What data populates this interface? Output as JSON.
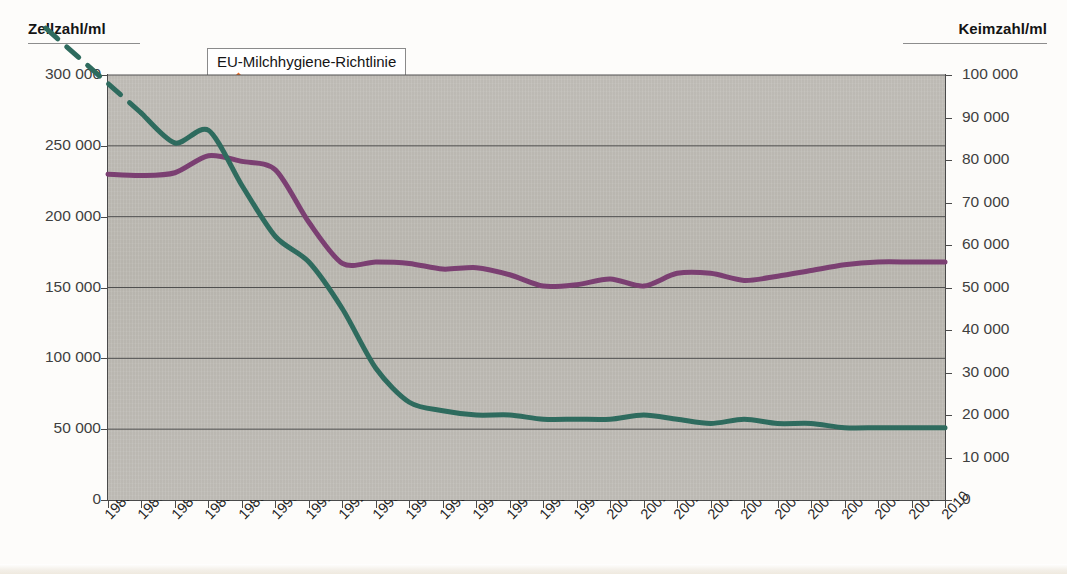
{
  "axes": {
    "left_title": "Zellzahl/ml",
    "right_title": "Keimzahl/ml"
  },
  "legend": {
    "position": "inside-top-center",
    "entries": [
      {
        "label": "Zellzahl (geom. Mittelwert)",
        "color": "#7B3F72"
      },
      {
        "label": "Keimzahl (geom. Mittelwert)",
        "color": "#2E6B5E"
      }
    ]
  },
  "annotations": {
    "eu_directive": "EU-Milchhygiene-Richtlinie",
    "pyruvat": "Pyruvat",
    "keimzahl": "Keimzahl"
  },
  "colors": {
    "zellzahl": "#7B3F72",
    "keimzahl": "#2E6B5E",
    "arrow_orange": "#EF6B1F",
    "arrow_black": "#111111",
    "plot_background": "#B9B6B0",
    "gridline": "#4f4f4f"
  },
  "chart_data": {
    "type": "line",
    "title": "",
    "xlabel": "",
    "ylabel": "Zellzahl/ml",
    "y2label": "Keimzahl/ml",
    "grid": true,
    "x": [
      1985,
      1986,
      1987,
      1988,
      1989,
      1990,
      1991,
      1992,
      1993,
      1994,
      1995,
      1996,
      1997,
      1998,
      1999,
      2000,
      2001,
      2002,
      2003,
      2004,
      2005,
      2006,
      2007,
      2008,
      2009,
      2010
    ],
    "xtick_labels": [
      "1985",
      "1986",
      "1987",
      "1988",
      "1989",
      "1990",
      "1991",
      "1992",
      "1993",
      "1994",
      "1995",
      "1996",
      "1997",
      "1998",
      "1999",
      "2000",
      "2001",
      "2002",
      "2003",
      "2004",
      "2005",
      "2006",
      "2007",
      "2008",
      "2009",
      "2010"
    ],
    "ylim": [
      0,
      300000
    ],
    "yticks": [
      0,
      50000,
      100000,
      150000,
      200000,
      250000,
      300000
    ],
    "ytick_labels": [
      "0",
      "50 000",
      "100 000",
      "150 000",
      "200 000",
      "250 000",
      "300 000"
    ],
    "y2lim": [
      0,
      100000
    ],
    "y2ticks": [
      0,
      10000,
      20000,
      30000,
      40000,
      50000,
      60000,
      70000,
      80000,
      90000,
      100000
    ],
    "y2tick_labels": [
      "0",
      "10 000",
      "20 000",
      "30 000",
      "40 000",
      "50 000",
      "60 000",
      "70 000",
      "80 000",
      "90 000",
      "100 000"
    ],
    "series": [
      {
        "name": "Zellzahl (geom. Mittelwert)",
        "axis": "left",
        "unit": "Zellen/ml",
        "color": "#7B3F72",
        "values": [
          230000,
          229000,
          231000,
          243000,
          239000,
          233000,
          196000,
          167000,
          168000,
          167000,
          163000,
          164000,
          159000,
          151000,
          152000,
          156000,
          151000,
          160000,
          160000,
          155000,
          158000,
          162000,
          166000,
          168000,
          168000,
          168000
        ]
      },
      {
        "name": "Keimzahl (geom. Mittelwert)",
        "axis": "right",
        "unit": "KbE/ml",
        "color": "#2E6B5E",
        "dashed_lead_in": true,
        "values": [
          null,
          91000,
          84000,
          87000,
          74000,
          62000,
          56000,
          45000,
          31000,
          23000,
          21000,
          20000,
          20000,
          19000,
          19000,
          19000,
          20000,
          19000,
          18000,
          19000,
          18000,
          18000,
          17000,
          17000,
          17000,
          17000
        ]
      }
    ]
  }
}
